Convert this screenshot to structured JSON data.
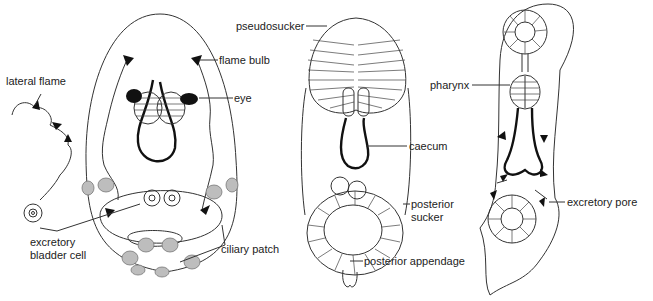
{
  "figure": {
    "panels": [
      {
        "id": "larva-left",
        "labels": {
          "lateral_flame": "lateral flame",
          "flame_bulb": "flame bulb",
          "eye": "eye",
          "excretory_bladder_cell": [
            "excretory",
            "bladder cell"
          ],
          "ciliary_patch": "ciliary patch"
        }
      },
      {
        "id": "larva-middle",
        "labels": {
          "pseudosucker": "pseudosucker",
          "caecum": "caecum",
          "posterior_sucker": [
            "posterior",
            "sucker"
          ],
          "posterior_appendage": "posterior appendage"
        }
      },
      {
        "id": "larva-right",
        "labels": {
          "pharynx": "pharynx",
          "excretory_pore": "excretory pore"
        }
      }
    ],
    "colors": {
      "line": "#333333",
      "ciliary_spot": "#bdbdbd",
      "eye": "#111111",
      "background": "#ffffff"
    }
  }
}
